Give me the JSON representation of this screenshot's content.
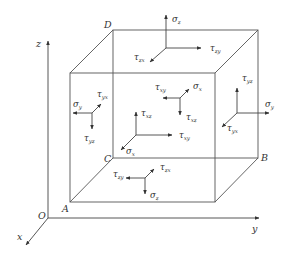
{
  "figure": {
    "stroke_color": "#555555",
    "background": "#ffffff"
  },
  "axes": {
    "origin": "O",
    "x": "x",
    "y": "y",
    "z": "z"
  },
  "vertices": {
    "A": "A",
    "B": "B",
    "C": "C",
    "D": "D"
  },
  "stress_labels": {
    "top_face": [
      {
        "sym": "σ",
        "sub": "z"
      },
      {
        "sym": "τ",
        "sub": "zy"
      },
      {
        "sym": "τ",
        "sub": "zx"
      }
    ],
    "left_face": [
      {
        "sym": "σ",
        "sub": "y"
      },
      {
        "sym": "τ",
        "sub": "yx"
      },
      {
        "sym": "τ",
        "sub": "yz"
      }
    ],
    "back_face": [
      {
        "sym": "τ",
        "sub": "xz"
      },
      {
        "sym": "τ",
        "sub": "xy"
      },
      {
        "sym": "σ",
        "sub": "x"
      }
    ],
    "front_face": [
      {
        "sym": "τ",
        "sub": "xy"
      },
      {
        "sym": "σ",
        "sub": "x"
      },
      {
        "sym": "τ",
        "sub": "xz"
      }
    ],
    "right_face": [
      {
        "sym": "τ",
        "sub": "yz"
      },
      {
        "sym": "σ",
        "sub": "y"
      },
      {
        "sym": "τ",
        "sub": "yx"
      }
    ],
    "bottom_face": [
      {
        "sym": "τ",
        "sub": "zy"
      },
      {
        "sym": "τ",
        "sub": "zx"
      },
      {
        "sym": "σ",
        "sub": "z"
      }
    ]
  }
}
